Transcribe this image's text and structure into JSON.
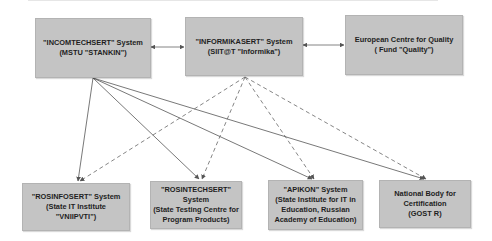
{
  "diagram": {
    "top_boxes": [
      {
        "id": "incomtechsert",
        "line1": "\"INCOMTECHSERT\" System",
        "line2": "(MSTU \"STANKIN\")"
      },
      {
        "id": "informikasert",
        "line1": "\"INFORMIKASERT\" System",
        "line2": "(SIIT@T \"Informika\")"
      },
      {
        "id": "ecq",
        "line1": "European Centre for Quality",
        "line2": "( Fund \"Quality\")"
      }
    ],
    "bottom_boxes": [
      {
        "id": "rosinfosert",
        "line1": "\"ROSINFOSERT\"  System",
        "line2": "(State IT Institute",
        "line3": "\"VNIIPVTI\")"
      },
      {
        "id": "rosintechsert",
        "line1": "\"ROSINTECHSERT\"  System",
        "line2": "(State Testing Centre for",
        "line3": "Program Products)"
      },
      {
        "id": "apikon",
        "line1": "\"APIKON\" System",
        "line2": "(State Institute for IT in",
        "line3": "Education, Russian",
        "line4": "Academy of Education)"
      },
      {
        "id": "gost",
        "line1": "National Body for",
        "line2": "Certification",
        "line3": "(GOST R)"
      }
    ],
    "edges": {
      "bidirectional": [
        [
          "incomtechsert",
          "informikasert"
        ],
        [
          "informikasert",
          "ecq"
        ]
      ],
      "solid_from_incomtechsert_to": [
        "rosinfosert",
        "rosintechsert",
        "apikon",
        "gost"
      ],
      "dashed_from_informikasert_to": [
        "rosinfosert",
        "rosintechsert",
        "apikon",
        "gost"
      ]
    },
    "colors": {
      "box_fill": "#c4c4c4",
      "line": "#555555"
    }
  }
}
